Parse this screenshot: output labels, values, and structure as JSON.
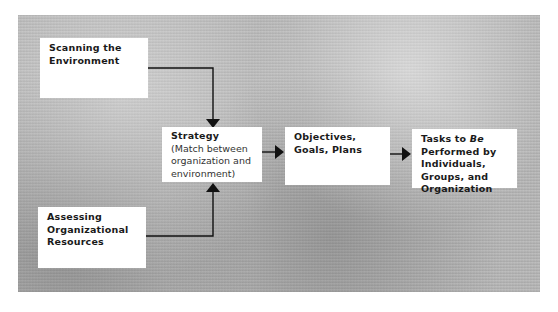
{
  "diagram": {
    "type": "flowchart",
    "nodes": {
      "scanning": {
        "title": "Scanning the Environment"
      },
      "assessing": {
        "title": "Assessing Organizational Resources"
      },
      "strategy": {
        "title": "Strategy",
        "subtitle": "(Match between organization and environment)"
      },
      "objectives": {
        "title": "Objectives, Goals, Plans"
      },
      "tasks": {
        "title_part1": "Tasks to ",
        "title_italic": "Be",
        "title_part2": " Performed by Individuals, Groups, and Organization"
      }
    },
    "edges": [
      {
        "from": "Scanning the Environment",
        "to": "Strategy"
      },
      {
        "from": "Assessing Organizational Resources",
        "to": "Strategy"
      },
      {
        "from": "Strategy",
        "to": "Objectives, Goals, Plans"
      },
      {
        "from": "Objectives, Goals, Plans",
        "to": "Tasks to Be Performed by Individuals, Groups, and Organization"
      }
    ]
  }
}
